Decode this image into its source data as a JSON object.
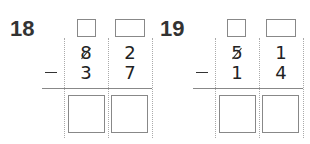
{
  "problems": [
    {
      "number": "18",
      "operator": "−",
      "top": {
        "tens": "8",
        "ones": "2",
        "tens_crossed": true
      },
      "bottom": {
        "tens": "3",
        "ones": "7"
      },
      "carry_boxes": [
        "",
        ""
      ],
      "answer_boxes": [
        "",
        ""
      ]
    },
    {
      "number": "19",
      "operator": "−",
      "top": {
        "tens": "5",
        "ones": "1",
        "tens_crossed": true
      },
      "bottom": {
        "tens": "1",
        "ones": "4"
      },
      "carry_boxes": [
        "",
        ""
      ],
      "answer_boxes": [
        "",
        ""
      ]
    }
  ]
}
